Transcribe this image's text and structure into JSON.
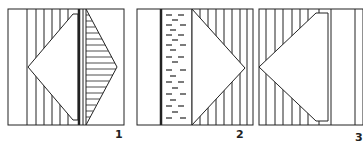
{
  "figures": [
    {
      "label": "1",
      "description": "square with vertical hatching left, white triangle pointing left, thick divider, horizontally hatched triangle pointing right"
    },
    {
      "label": "2",
      "description": "square with thick vertical bar, dashed-fill column, white triangle pointing right with vertical hatching"
    },
    {
      "label": "3",
      "description": "square with vertical hatching and white trapezoid pointing left"
    }
  ],
  "colors": {
    "stroke": "#222222",
    "background": "#ffffff"
  }
}
